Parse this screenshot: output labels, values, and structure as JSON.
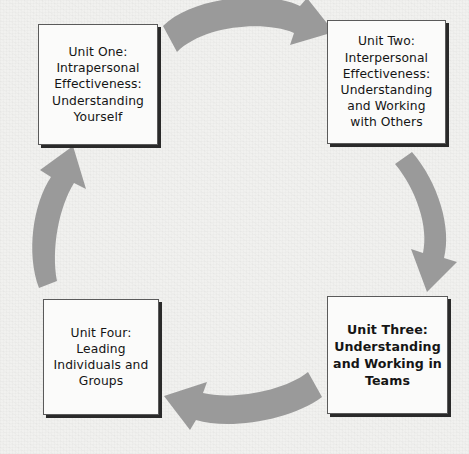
{
  "diagram": {
    "type": "cycle-diagram",
    "background_color": "#f1f1ef",
    "arrow_color": "#9a9a9a",
    "box_fill_color": "#fbfbfa",
    "box_border_color": "#5a5a5a",
    "box_shadow_color": "#2a2a2a",
    "text_color": "#151515",
    "flow_direction": "clockwise",
    "nodes": [
      {
        "id": "unit-one",
        "label": "Unit One:\nIntrapersonal\nEffectiveness:\nUnderstanding\nYourself",
        "emphasis": "normal",
        "position": "top-left"
      },
      {
        "id": "unit-two",
        "label": "Unit Two:\nInterpersonal\nEffectiveness:\nUnderstanding\nand Working\nwith Others",
        "emphasis": "normal",
        "position": "top-right"
      },
      {
        "id": "unit-three",
        "label": "Unit Three:\nUnderstanding\nand Working in\nTeams",
        "emphasis": "bold",
        "position": "bottom-right"
      },
      {
        "id": "unit-four",
        "label": "Unit Four:\nLeading\nIndividuals and\nGroups",
        "emphasis": "normal",
        "position": "bottom-left"
      }
    ],
    "arrows": [
      {
        "id": "arrow-top",
        "from": "unit-one",
        "to": "unit-two",
        "direction": "right",
        "name": "curved-arrow-right-icon"
      },
      {
        "id": "arrow-right",
        "from": "unit-two",
        "to": "unit-three",
        "direction": "down",
        "name": "curved-arrow-down-icon"
      },
      {
        "id": "arrow-bottom",
        "from": "unit-three",
        "to": "unit-four",
        "direction": "left",
        "name": "curved-arrow-left-icon"
      },
      {
        "id": "arrow-left",
        "from": "unit-four",
        "to": "unit-one",
        "direction": "up",
        "name": "curved-arrow-up-icon"
      }
    ]
  }
}
